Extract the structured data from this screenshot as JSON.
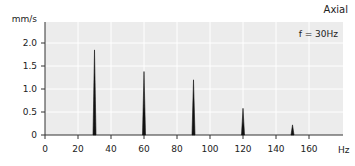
{
  "chart_data": {
    "type": "line",
    "title": "Axial",
    "annotation": "f = 30Hz",
    "xlabel": "Hz",
    "ylabel": "mm/s",
    "xlim": [
      0,
      180
    ],
    "ylim": [
      0,
      2.4
    ],
    "x_ticks": [
      0,
      20,
      40,
      60,
      80,
      100,
      120,
      140,
      160
    ],
    "y_ticks": [
      0,
      0.5,
      1.0,
      1.5,
      2.0
    ],
    "y_tick_labels": [
      "0",
      "0.5",
      "1.0",
      "1.5",
      "2.0"
    ],
    "grid": true,
    "series": [
      {
        "name": "Axial spectrum",
        "peaks": [
          {
            "x": 30,
            "y": 1.85
          },
          {
            "x": 60,
            "y": 1.38
          },
          {
            "x": 90,
            "y": 1.2
          },
          {
            "x": 120,
            "y": 0.58
          },
          {
            "x": 150,
            "y": 0.22
          }
        ]
      }
    ]
  },
  "colors": {
    "plot_bg": "#ececec",
    "grid": "#ffffff",
    "line": "#111111",
    "axis": "#333333"
  }
}
